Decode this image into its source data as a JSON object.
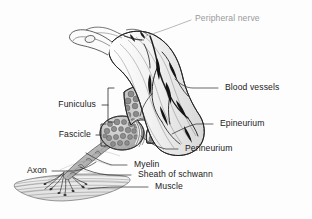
{
  "figure": {
    "background_color": "#fdfdfd",
    "line_color": "#2b2b2b",
    "label_color": "#1a1a1a",
    "muted_label_color": "#9a9a9a"
  },
  "labels": {
    "peripheral_nerve": "Peripheral nerve",
    "blood_vessels": "Blood vessels",
    "epineurium": "Epineurium",
    "perineurium": "Perineurium",
    "funiculus": "Funiculus",
    "fascicle": "Fascicle",
    "axon": "Axon",
    "myelin": "Myelin",
    "sheath_of_schwann": "Sheath of schwann",
    "muscle": "Muscle"
  },
  "structures": [
    {
      "name": "peripheral-nerve-trunk",
      "label": "Peripheral nerve"
    },
    {
      "name": "blood-vessels",
      "label": "Blood vessels"
    },
    {
      "name": "epineurium",
      "label": "Epineurium"
    },
    {
      "name": "perineurium",
      "label": "Perineurium"
    },
    {
      "name": "funiculus",
      "label": "Funiculus"
    },
    {
      "name": "fascicle",
      "label": "Fascicle"
    },
    {
      "name": "axon",
      "label": "Axon"
    },
    {
      "name": "myelin-sheath",
      "label": "Myelin"
    },
    {
      "name": "sheath-of-schwann",
      "label": "Sheath of schwann"
    },
    {
      "name": "skeletal-muscle",
      "label": "Muscle"
    }
  ]
}
